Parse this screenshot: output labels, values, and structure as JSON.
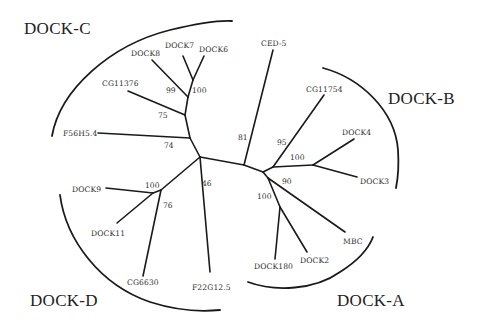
{
  "figure": {
    "type": "unrooted phylogenetic tree"
  },
  "clades": {
    "dock_c": "DOCK-C",
    "dock_b": "DOCK-B",
    "dock_a": "DOCK-A",
    "dock_d": "DOCK-D"
  },
  "leaves": {
    "dock7": "DOCK7",
    "dock6": "DOCK6",
    "dock8": "DOCK8",
    "cg11376": "CG11376",
    "f56h5_4": "F56H5.4",
    "ced5": "CED-5",
    "cg11754": "CG11754",
    "dock4": "DOCK4",
    "dock3": "DOCK3",
    "mbc": "MBC",
    "dock180": "DOCK180",
    "dock2": "DOCK2",
    "dock9": "DOCK9",
    "dock11": "DOCK11",
    "cg6630": "CG6630",
    "f22g12_5": "F22G12.5"
  },
  "bootstrap": {
    "dock6_dock7": "100",
    "dock8_group": "99",
    "cg11376_group": "75",
    "f56h5_4_group": "74",
    "ced5": "81",
    "cg11754_group": "95",
    "dock3_dock4": "100",
    "mbc_group": "90",
    "dock180_dock2": "100",
    "dock9_dock11": "100",
    "cg6630_group": "76",
    "f22g12_5": "46"
  },
  "clade_members": {
    "DOCK-A": [
      "DOCK180",
      "DOCK2",
      "MBC",
      "CED-5"
    ],
    "DOCK-B": [
      "DOCK3",
      "DOCK4",
      "CG11754"
    ],
    "DOCK-C": [
      "DOCK6",
      "DOCK7",
      "DOCK8",
      "CG11376",
      "F56H5.4"
    ],
    "DOCK-D": [
      "DOCK9",
      "DOCK11",
      "CG6630",
      "F22G12.5"
    ]
  }
}
